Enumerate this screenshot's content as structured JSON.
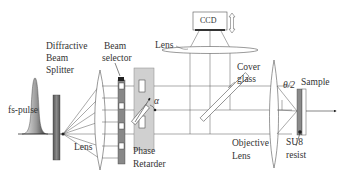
{
  "diagram": {
    "labels": {
      "diffractive": "Diffractive",
      "beam": "Beam",
      "splitter": "Splitter",
      "beam2": "Beam",
      "selector": "selector",
      "lens_top": "Lens",
      "ccd": "CCD",
      "cover": "Cover",
      "glass": "glass",
      "sample": "Sample",
      "theta": "θ/2",
      "alpha": "α",
      "fs_pulse": "fs-pulse",
      "lens_bottom": "Lens",
      "phase": "Phase",
      "retarder": "Retarder",
      "objective": "Objective",
      "objective_lens": "Lens",
      "su8": "SU8",
      "resist": "resist"
    },
    "colors": {
      "line": "#555555",
      "component_fill": "#c8c8c8",
      "dark_fill": "#777777",
      "sample_fill": "#8a8a8a"
    }
  }
}
